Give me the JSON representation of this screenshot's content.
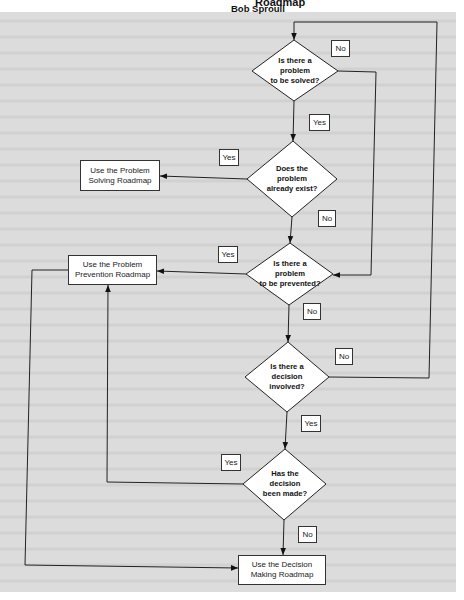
{
  "header": {
    "title_fragment": "Roadmap",
    "author": "Bob Sproull"
  },
  "flowchart": {
    "decisions": [
      {
        "id": "d1",
        "text": "Is there a\nproblem\nto be solved?"
      },
      {
        "id": "d2",
        "text": "Does the\nproblem\nalready exist?"
      },
      {
        "id": "d3",
        "text": "Is there a\nproblem\nto be prevented?"
      },
      {
        "id": "d4",
        "text": "Is there a\ndecision\ninvolved?"
      },
      {
        "id": "d5",
        "text": "Has the\ndecision\nbeen made?"
      }
    ],
    "outcomes": [
      {
        "id": "o1",
        "text": "Use the Problem\nSolving Roadmap"
      },
      {
        "id": "o2",
        "text": "Use the Problem\nPrevention Roadmap"
      },
      {
        "id": "o3",
        "text": "Use the Decision\nMaking Roadmap"
      }
    ],
    "edge_labels": {
      "d1_no": "No",
      "d1_yes": "Yes",
      "d2_yes": "Yes",
      "d2_no": "No",
      "d3_yes": "Yes",
      "d3_no": "No",
      "d4_no": "No",
      "d4_yes": "Yes",
      "d5_yes": "Yes",
      "d5_no": "No"
    },
    "edges": [
      {
        "from": "d1",
        "to": "d3",
        "label": "No"
      },
      {
        "from": "d1",
        "to": "d2",
        "label": "Yes"
      },
      {
        "from": "d2",
        "to": "o1",
        "label": "Yes"
      },
      {
        "from": "d2",
        "to": "d3",
        "label": "No"
      },
      {
        "from": "d3",
        "to": "o2",
        "label": "Yes"
      },
      {
        "from": "d3",
        "to": "d4",
        "label": "No"
      },
      {
        "from": "d4",
        "to": "d1",
        "label": "No"
      },
      {
        "from": "d4",
        "to": "d5",
        "label": "Yes"
      },
      {
        "from": "d5",
        "to": "o2",
        "label": "Yes"
      },
      {
        "from": "d5",
        "to": "o3",
        "label": "No"
      },
      {
        "from": "o2",
        "to": "o3",
        "label": ""
      }
    ]
  },
  "colors": {
    "page": "#dcdcdc",
    "line": "#222222",
    "node_fill": "#ffffff"
  }
}
